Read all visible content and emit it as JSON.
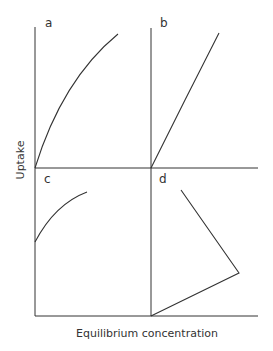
{
  "figure": {
    "y_axis_label": "Uptake",
    "x_axis_label": "Equilibrium concentration",
    "line_color": "#333333",
    "panels": [
      {
        "id": "a",
        "label": "a",
        "shape": "concave curve rising from origin"
      },
      {
        "id": "b",
        "label": "b",
        "shape": "straight line rising from origin"
      },
      {
        "id": "c",
        "label": "c",
        "shape": "concave curve starting above origin"
      },
      {
        "id": "d",
        "label": "d",
        "shape": "line rising from origin then reversing back toward upper left"
      }
    ]
  }
}
